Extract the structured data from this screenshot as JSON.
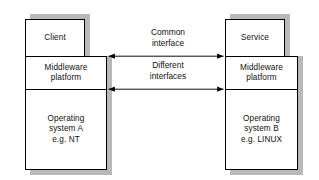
{
  "diagram": {
    "colors": {
      "box_fill": "#ffffff",
      "box_border": "#000000",
      "shadow": "#b9b9b9",
      "text": "#111111",
      "arrow": "#000000"
    },
    "left_stack": {
      "top_box": {
        "label": "Client"
      },
      "middle_box": {
        "label": "Middleware\nplatform"
      },
      "bottom_box": {
        "label": "Operating\nsystem A\ne.g. NT"
      }
    },
    "right_stack": {
      "top_box": {
        "label": "Service"
      },
      "middle_box": {
        "label": "Middleware\nplatform"
      },
      "bottom_box": {
        "label": "Operating\nsystem B\ne.g. LINUX"
      }
    },
    "connectors": [
      {
        "name": "common-interface",
        "label": "Common\ninterface",
        "direction": "bidirectional",
        "y": 56
      },
      {
        "name": "different-interfaces",
        "label": "Different\ninterfaces",
        "direction": "bidirectional",
        "y": 89
      }
    ]
  }
}
